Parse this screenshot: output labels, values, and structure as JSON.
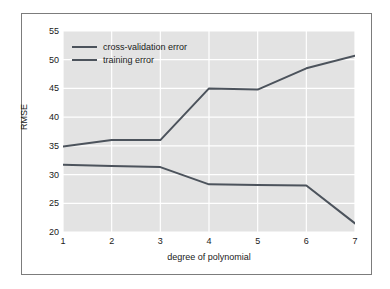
{
  "chart_data": {
    "type": "line",
    "title": "",
    "subtitle": "",
    "xlabel": "degree of polynomial",
    "ylabel": "RMSE",
    "x": [
      1,
      2,
      3,
      4,
      5,
      6,
      7
    ],
    "xticklabels": [
      "1",
      "2",
      "3",
      "4",
      "5",
      "6",
      "7"
    ],
    "yticklabels": [
      "20",
      "25",
      "30",
      "35",
      "40",
      "45",
      "50",
      "55"
    ],
    "yticks": [
      20,
      25,
      30,
      35,
      40,
      45,
      50,
      55
    ],
    "xlim": [
      1,
      7
    ],
    "ylim": [
      20,
      55
    ],
    "grid": true,
    "grid_color": "#ffffff",
    "plot_background": "#e3e3e3",
    "figure_background": "#ffffff",
    "legend_position": "upper left",
    "series": [
      {
        "name": "cross-validation error",
        "color": "#4c535c",
        "values": [
          34.9,
          36.0,
          36.0,
          45.0,
          44.8,
          48.5,
          50.7
        ]
      },
      {
        "name": "training error",
        "color": "#4c535c",
        "values": [
          31.7,
          31.5,
          31.3,
          28.3,
          28.2,
          28.1,
          21.5
        ]
      }
    ]
  },
  "legend": {
    "entries": [
      {
        "label": "cross-validation error"
      },
      {
        "label": "training error"
      }
    ]
  },
  "colors": {
    "line": "#4c535c",
    "grid": "#ffffff",
    "plot_bg": "#e3e3e3",
    "frame": "#7c7c7c",
    "text": "#1a1a1a"
  }
}
